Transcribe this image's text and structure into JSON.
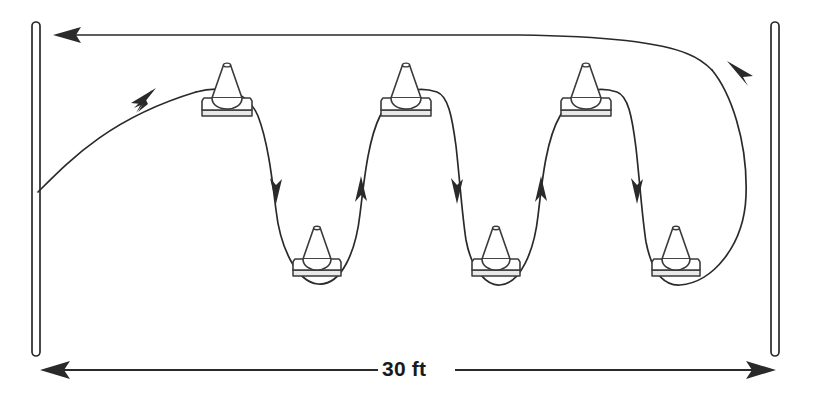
{
  "diagram": {
    "dimension": {
      "label": "30 ft",
      "value": 30,
      "unit": "ft"
    },
    "colors": {
      "ink": "#2a2a2a",
      "cone_outline": "#3a3a3a",
      "base_shadow": "#e9e9e9",
      "background": "#ffffff"
    },
    "posts": [
      {
        "name": "start-post-left",
        "x": 36,
        "top": 22,
        "bottom": 356
      },
      {
        "name": "finish-post-right",
        "x": 775,
        "top": 22,
        "bottom": 356
      }
    ],
    "cones": [
      {
        "name": "cone-top-1",
        "row": "top",
        "index": 1,
        "cx": 227,
        "base_y": 112
      },
      {
        "name": "cone-top-2",
        "row": "top",
        "index": 2,
        "cx": 406,
        "base_y": 112
      },
      {
        "name": "cone-top-3",
        "row": "top",
        "index": 3,
        "cx": 586,
        "base_y": 112
      },
      {
        "name": "cone-bottom-1",
        "row": "bottom",
        "index": 1,
        "cx": 317,
        "base_y": 272
      },
      {
        "name": "cone-bottom-2",
        "row": "bottom",
        "index": 2,
        "cx": 496,
        "base_y": 272
      },
      {
        "name": "cone-bottom-3",
        "row": "bottom",
        "index": 3,
        "cx": 676,
        "base_y": 272
      }
    ],
    "cone_count": 6,
    "paths": {
      "entry": "M 38 192 C 70 160, 110 118, 196 92",
      "weave": "M 196 92 C 218 86, 246 88, 258 116 C 268 142, 272 178, 276 210 C 280 246, 296 282, 318 284 C 342 286, 356 250, 360 214 C 364 182, 368 140, 380 116 C 392 90, 418 86, 437 92 C 448 96, 452 116, 456 146 C 460 182, 462 214, 466 240 C 472 272, 488 286, 500 285 C 520 284, 534 252, 538 216 C 542 182, 546 140, 560 116 C 572 90, 598 86, 617 92 C 628 96, 632 116, 636 148 C 640 184, 642 216, 646 242 C 652 272, 664 286, 680 285 C 712 283, 744 246, 746 196 C 748 140, 730 92, 712 70",
      "return": "M 712 70 C 706 64, 698 58, 688 54 C 660 42, 600 36, 520 35 L 60 35"
    },
    "arrows": [
      {
        "name": "arrow-entry",
        "direction": "up-right",
        "x": 152,
        "y": 96
      },
      {
        "name": "arrow-down-1",
        "direction": "down",
        "x": 276,
        "y": 196
      },
      {
        "name": "arrow-up-1",
        "direction": "up",
        "x": 361,
        "y": 196
      },
      {
        "name": "arrow-down-2",
        "direction": "down",
        "x": 456,
        "y": 196
      },
      {
        "name": "arrow-up-2",
        "direction": "up",
        "x": 541,
        "y": 196
      },
      {
        "name": "arrow-down-3",
        "direction": "down",
        "x": 636,
        "y": 196
      },
      {
        "name": "arrow-turn-right",
        "direction": "up-left",
        "x": 736,
        "y": 66
      },
      {
        "name": "arrow-return-left",
        "direction": "left",
        "x": 56,
        "y": 35
      }
    ],
    "dimension_line": {
      "y": 370,
      "left_x": 42,
      "right_x": 774,
      "gap_left": 378,
      "gap_right": 455,
      "label_x": 382,
      "label_y": 360
    }
  }
}
